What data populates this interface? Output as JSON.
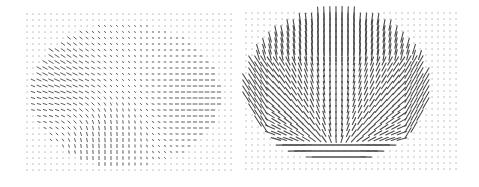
{
  "figure": {
    "background": "#ffffff",
    "dot_color": "#9a9a9a",
    "arrow_color": "#4a4a4a"
  },
  "chart_data": [
    {
      "type": "quiver",
      "title": "",
      "xlabel": "",
      "ylabel": "",
      "grid": false,
      "legend": "none",
      "panel": "left",
      "description": "Weak vector field; small arrows on a regular grid, stronger diagonal flow at upper-left and horizontal flow on right side of an elliptical region",
      "grid_bounds_px": {
        "x0": 27,
        "x1": 231,
        "y0": 14,
        "y1": 175
      },
      "spacing_px": 6,
      "region": {
        "cx": 125,
        "cy": 95,
        "rx": 95,
        "ry": 72
      },
      "magnitude_scale": 0.45,
      "features": [
        {
          "name": "upper-left diagonal swirl",
          "cx": 55,
          "cy": 60,
          "strength": 1.0,
          "angle_deg": 40
        },
        {
          "name": "left horizontal band",
          "cx": 60,
          "cy": 95,
          "strength": 0.7,
          "angle_deg": 0
        },
        {
          "name": "lower-center vertical",
          "cx": 100,
          "cy": 140,
          "strength": 0.8,
          "angle_deg": 90
        },
        {
          "name": "right horizontal band",
          "cx": 200,
          "cy": 100,
          "strength": 0.9,
          "angle_deg": 0
        }
      ]
    },
    {
      "type": "quiver",
      "title": "",
      "xlabel": "",
      "ylabel": "",
      "grid": false,
      "legend": "none",
      "panel": "right",
      "description": "Strong vector field inside an elliptical region; vertical arrows at top, diagonal at left/right edges, converging fan toward bottom center, horizontal arrows at bottom",
      "grid_bounds_px": {
        "x0": 6,
        "x1": 216,
        "y0": 13,
        "y1": 174
      },
      "spacing_px": 6,
      "region": {
        "cx": 97,
        "cy": 86,
        "rx": 92,
        "ry": 75
      },
      "magnitude_scale": 1.0,
      "features": [
        {
          "name": "top vertical columns",
          "cx": 80,
          "cy": 35,
          "strength": 1.0,
          "angle_deg": 90
        },
        {
          "name": "left diagonal edge",
          "cx": 20,
          "cy": 85,
          "strength": 1.0,
          "angle_deg": 55
        },
        {
          "name": "right diagonal edge",
          "cx": 170,
          "cy": 80,
          "strength": 1.0,
          "angle_deg": 115
        },
        {
          "name": "bottom converging fan",
          "cx": 97,
          "cy": 150,
          "strength": 1.0,
          "angle_deg": 0
        },
        {
          "name": "bottom horizontal streaks",
          "cx": 97,
          "cy": 158,
          "strength": 1.0,
          "angle_deg": 0
        }
      ]
    }
  ]
}
